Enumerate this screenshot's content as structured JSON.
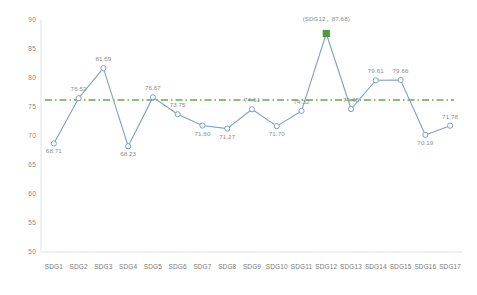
{
  "chart_data": {
    "type": "line",
    "title": "",
    "subtitle": "",
    "xlabel": "",
    "ylabel": "",
    "grid": false,
    "legend_position": "none",
    "ylim": [
      50,
      90
    ],
    "yticks": [
      "50",
      "55",
      "60",
      "65",
      "70",
      "75",
      "80",
      "85",
      "90"
    ],
    "categories": [
      "SDG1",
      "SDG2",
      "SDG3",
      "SDG4",
      "SDG5",
      "SDG6",
      "SDG7",
      "SDG8",
      "SDG9",
      "SDG10",
      "SDG11",
      "SDG12",
      "SDG13",
      "SDG14",
      "SDG15",
      "SDG16",
      "SDG17"
    ],
    "series": [
      {
        "name": "SDG score",
        "color": "#7f9fc4",
        "marker": "circle",
        "values": [
          68.71,
          76.52,
          81.69,
          68.23,
          76.67,
          73.75,
          71.8,
          71.27,
          74.61,
          71.7,
          74.32,
          87.68,
          74.65,
          79.61,
          79.66,
          70.19,
          71.78
        ],
        "labels": [
          "68.71",
          "76.52",
          "81.69",
          "68.23",
          "76.67",
          "73.75",
          "71.80",
          "71.27",
          "74.61",
          "71.70",
          "74.32",
          "87.68",
          "74.65",
          "79.61",
          "79.66",
          "70.19",
          "71.78"
        ]
      }
    ],
    "reference_line": {
      "name": "average",
      "value": 76.2,
      "color": "#6aa84f",
      "style": "dash-dot",
      "marker": "square"
    },
    "annotations": [
      {
        "name": "peak-callout",
        "text": "(SDG12，87.68)",
        "x_category": "SDG12",
        "y_value": 87.68,
        "marker_color": "#4e9a3f"
      }
    ]
  },
  "axis": {
    "y_tick_labels": [
      "90",
      "85",
      "80",
      "75",
      "70",
      "65",
      "60",
      "55",
      "50"
    ],
    "x_tick_labels": [
      "SDG1",
      "SDG2",
      "SDG3",
      "SDG4",
      "SDG5",
      "SDG6",
      "SDG7",
      "SDG8",
      "SDG9",
      "SDG10",
      "SDG11",
      "SDG12",
      "SDG13",
      "SDG14",
      "SDG15",
      "SDG16",
      "SDG17"
    ]
  },
  "colors": {
    "line": "#7f9fc4",
    "marker_fill": "#ffffff",
    "marker_stroke": "#7f9fc4",
    "reference": "#6aa84f",
    "peak_marker": "#4e9a3f",
    "axis_text": "#8a8a8a",
    "label_text": "#8c8c8c",
    "background": "#ffffff"
  }
}
